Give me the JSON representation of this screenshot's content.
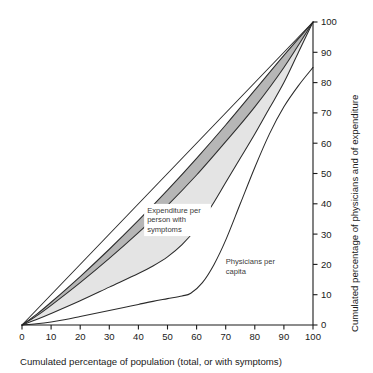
{
  "chart_data": {
    "type": "line",
    "title": "",
    "xlabel": "Cumulated percentage of population (total, or with symptoms)",
    "ylabel": "Cumulated percentage of physicians and of expenditure",
    "xlim": [
      0,
      100
    ],
    "ylim": [
      0,
      100
    ],
    "xticks": [
      "0",
      "10",
      "20",
      "30",
      "40",
      "50",
      "60",
      "70",
      "80",
      "90",
      "100"
    ],
    "yticks": [
      "0",
      "10",
      "20",
      "30",
      "40",
      "50",
      "60",
      "70",
      "80",
      "90",
      "100"
    ],
    "grid": false,
    "legend_position": "inline-annotations",
    "y_axis_side": "right",
    "colors": {
      "dark_band": "#b6b6b6",
      "light_band": "#e4e4e4",
      "line": "#2b2b2b",
      "text": "#1a1a1a",
      "background": "#ffffff"
    },
    "annotations": [
      {
        "name": "expenditure-label",
        "text_lines": [
          "Expenditure per",
          "person with",
          "symptoms"
        ],
        "x": 43,
        "y": 37
      },
      {
        "name": "physicians-label",
        "text_lines": [
          "Physicians per",
          "capita"
        ],
        "x": 70,
        "y": 20
      }
    ],
    "series": [
      {
        "name": "Equality line (line of perfect equality)",
        "style": "solid",
        "points": [
          [
            0,
            0
          ],
          [
            100,
            100
          ]
        ]
      },
      {
        "name": "Upper expenditure bound",
        "style": "solid",
        "points": [
          [
            0,
            0
          ],
          [
            5,
            3.5
          ],
          [
            10,
            7.5
          ],
          [
            20,
            16
          ],
          [
            30,
            25
          ],
          [
            40,
            34.5
          ],
          [
            50,
            44.5
          ],
          [
            60,
            55
          ],
          [
            70,
            66
          ],
          [
            80,
            77.5
          ],
          [
            90,
            89
          ],
          [
            100,
            100
          ]
        ]
      },
      {
        "name": "Expenditure per person with symptoms",
        "style": "solid",
        "points": [
          [
            0,
            0
          ],
          [
            5,
            3
          ],
          [
            10,
            6.5
          ],
          [
            20,
            14
          ],
          [
            30,
            22
          ],
          [
            40,
            30.5
          ],
          [
            50,
            39.5
          ],
          [
            60,
            49.5
          ],
          [
            70,
            60.5
          ],
          [
            80,
            72
          ],
          [
            90,
            85
          ],
          [
            100,
            100
          ]
        ]
      },
      {
        "name": "Lower expenditure bound",
        "style": "solid",
        "points": [
          [
            0,
            0
          ],
          [
            5,
            1.8
          ],
          [
            10,
            3.8
          ],
          [
            20,
            8
          ],
          [
            30,
            12.5
          ],
          [
            40,
            17
          ],
          [
            45,
            19.5
          ],
          [
            50,
            22.5
          ],
          [
            55,
            26.5
          ],
          [
            60,
            32
          ],
          [
            65,
            39
          ],
          [
            70,
            47
          ],
          [
            75,
            55
          ],
          [
            80,
            63
          ],
          [
            85,
            71.5
          ],
          [
            90,
            80
          ],
          [
            95,
            90
          ],
          [
            100,
            100
          ]
        ]
      },
      {
        "name": "Physicians per capita",
        "style": "solid",
        "points": [
          [
            0,
            0
          ],
          [
            5,
            0.4
          ],
          [
            10,
            1.0
          ],
          [
            15,
            1.8
          ],
          [
            20,
            2.8
          ],
          [
            25,
            3.8
          ],
          [
            30,
            4.8
          ],
          [
            35,
            5.8
          ],
          [
            40,
            6.8
          ],
          [
            45,
            7.8
          ],
          [
            50,
            8.7
          ],
          [
            55,
            9.6
          ],
          [
            58,
            10.5
          ],
          [
            62,
            14
          ],
          [
            66,
            20
          ],
          [
            70,
            28
          ],
          [
            75,
            40
          ],
          [
            80,
            52
          ],
          [
            85,
            63
          ],
          [
            90,
            72
          ],
          [
            95,
            79
          ],
          [
            100,
            85
          ]
        ]
      }
    ],
    "bands": [
      {
        "name": "dark-band",
        "fill": "#b6b6b6",
        "upper_series": "Upper expenditure bound",
        "lower_series": "Expenditure per person with symptoms"
      },
      {
        "name": "light-band",
        "fill": "#e4e4e4",
        "upper_series": "Expenditure per person with symptoms",
        "lower_series": "Lower expenditure bound"
      }
    ]
  }
}
